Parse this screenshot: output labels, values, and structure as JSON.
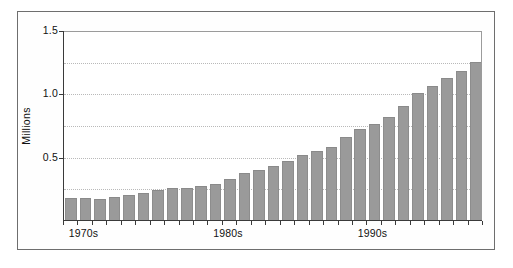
{
  "figure": {
    "background_color": "#ffffff",
    "frame_color": "#6e6e6e",
    "bar_color": "#9a9a9a",
    "axis_color": "#3a3a3a",
    "gridline_color": "#b9b9b9"
  },
  "chart_data": {
    "type": "bar",
    "title": "",
    "subtitle": "",
    "xlabel": "",
    "ylabel": "Millions",
    "ylim": [
      0,
      1.5
    ],
    "ytick_labels": [
      "1.5",
      "1.0",
      "0.5"
    ],
    "ytick_values": [
      1.5,
      1.0,
      0.5
    ],
    "gridlines": [
      1.25,
      1.0,
      0.75,
      0.5,
      0.25
    ],
    "grid": true,
    "legend": null,
    "legend_position": "none",
    "xtick_labels": [
      "1970s",
      "1980s",
      "1990s"
    ],
    "xtick_label_positions": [
      1,
      11,
      21
    ],
    "categories": [
      "1971",
      "1972",
      "1973",
      "1974",
      "1975",
      "1976",
      "1977",
      "1978",
      "1979",
      "1980",
      "1981",
      "1982",
      "1983",
      "1984",
      "1985",
      "1986",
      "1987",
      "1988",
      "1989",
      "1990",
      "1991",
      "1992",
      "1993",
      "1994",
      "1995",
      "1996",
      "1997",
      "1998",
      "1999"
    ],
    "values": [
      0.17,
      0.17,
      0.165,
      0.185,
      0.2,
      0.215,
      0.24,
      0.25,
      0.255,
      0.265,
      0.285,
      0.32,
      0.37,
      0.395,
      0.425,
      0.465,
      0.51,
      0.545,
      0.58,
      0.655,
      0.72,
      0.755,
      0.81,
      0.9,
      1.0,
      1.06,
      1.12,
      1.18,
      1.245
    ]
  }
}
